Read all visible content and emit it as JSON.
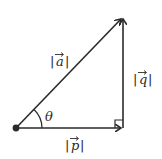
{
  "diagram": {
    "type": "right-triangle-vector-decomposition",
    "stroke_color": "#2a2a2a",
    "background": "#ffffff",
    "labels": {
      "hypotenuse": "a",
      "vertical": "q",
      "horizontal": "p",
      "angle": "θ"
    },
    "label_texts": {
      "hypotenuse": "|a|",
      "vertical": "|q|",
      "horizontal": "|p|"
    },
    "arrow_glyph": "→",
    "points": {
      "origin": [
        16,
        128
      ],
      "corner": [
        123,
        128
      ],
      "tip": [
        123,
        17
      ]
    },
    "right_angle_marker": true
  }
}
